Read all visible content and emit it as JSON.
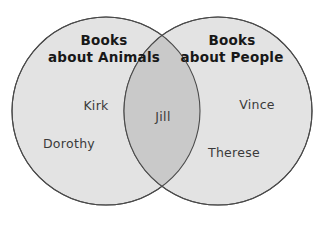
{
  "diagram": {
    "type": "venn-2-set",
    "background_color": "#ffffff",
    "circle_fill": "#e3e3e3",
    "intersection_fill": "#c9c9c9",
    "stroke_color": "#4a4a4a",
    "title_color": "#181818",
    "member_color": "#3a3a3a",
    "left_set": {
      "title_line_1": "Books",
      "title_line_2": "about Animals",
      "members": [
        {
          "name": "Kirk"
        },
        {
          "name": "Dorothy"
        }
      ]
    },
    "right_set": {
      "title_line_1": "Books",
      "title_line_2": "about People",
      "members": [
        {
          "name": "Vince"
        },
        {
          "name": "Therese"
        }
      ]
    },
    "intersection": {
      "members": [
        {
          "name": "Jill"
        }
      ]
    }
  }
}
